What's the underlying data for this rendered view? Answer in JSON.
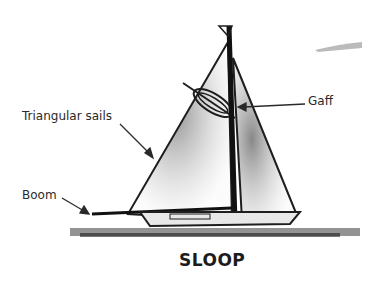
{
  "diagram": {
    "title": "SLOOP",
    "labels": [
      {
        "id": "triangular-sails",
        "text": "Triangular sails"
      },
      {
        "id": "gaff",
        "text": "Gaff"
      },
      {
        "id": "boom",
        "text": "Boom"
      }
    ],
    "colors": {
      "ink": "#1e1e1e",
      "shade": "#8a8a8a",
      "background": "#ffffff"
    }
  }
}
